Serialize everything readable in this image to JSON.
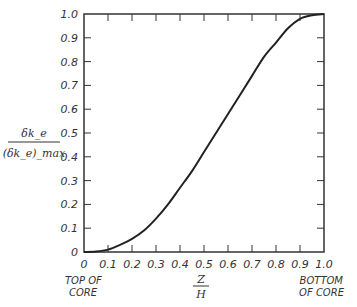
{
  "chart_data": {
    "type": "line",
    "title": "",
    "xlabel": {
      "numerator": "Z",
      "denominator": "H"
    },
    "ylabel": {
      "numerator": "δk_e",
      "denominator": "(δk_e)_max"
    },
    "x_annotations": {
      "left": [
        "TOP OF",
        "CORE"
      ],
      "right": [
        "BOTTOM",
        "OF CORE"
      ]
    },
    "xlim": [
      0,
      1.0
    ],
    "ylim": [
      0,
      1.0
    ],
    "grid": false,
    "x_ticks": [
      "0",
      "0.1",
      "0.2",
      "0.3",
      "0.4",
      "0.5",
      "0.6",
      "0.7",
      "0.8",
      "0.9",
      "1.0"
    ],
    "y_ticks": [
      "0",
      "0.1",
      "0.2",
      "0.3",
      "0.4",
      "0.5",
      "0.6",
      "0.7",
      "0.8",
      "0.9",
      "1.0"
    ],
    "series": [
      {
        "name": "normalized rod worth",
        "x": [
          0,
          0.05,
          0.1,
          0.15,
          0.2,
          0.25,
          0.3,
          0.35,
          0.4,
          0.45,
          0.5,
          0.55,
          0.6,
          0.65,
          0.7,
          0.75,
          0.8,
          0.85,
          0.9,
          0.95,
          1.0
        ],
        "y": [
          0,
          0.002,
          0.01,
          0.03,
          0.055,
          0.09,
          0.14,
          0.2,
          0.27,
          0.34,
          0.42,
          0.5,
          0.58,
          0.66,
          0.74,
          0.82,
          0.88,
          0.94,
          0.98,
          0.995,
          1.0
        ]
      }
    ]
  }
}
